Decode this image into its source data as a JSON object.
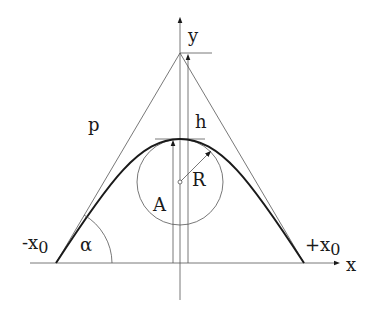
{
  "figure": {
    "labels": {
      "y_axis": "y",
      "x_axis": "x",
      "h": "h",
      "R": "R",
      "A": "A",
      "p": "p",
      "alpha": "α",
      "minus_x0_prefix": "-x",
      "plus_x0_prefix": "+x",
      "subscript_zero": "0"
    },
    "colors": {
      "line": "#555555",
      "curve": "#1a1a1a",
      "background": "#ffffff"
    }
  }
}
